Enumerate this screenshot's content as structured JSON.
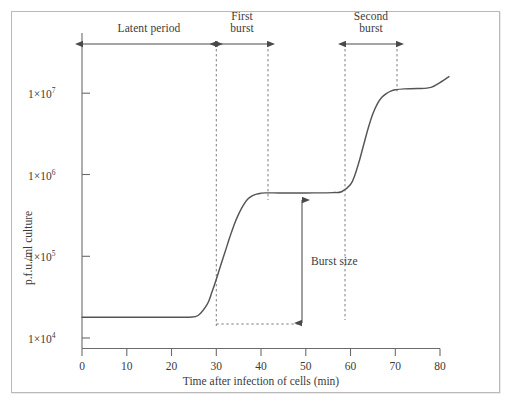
{
  "figure": {
    "frame_color": "#b9b9b9",
    "line_color": "#555555",
    "axis_color": "#6b6b6b"
  },
  "chart_data": {
    "type": "line",
    "title": "",
    "subtitle": "",
    "xlabel": "Time after infection of cells (min)",
    "ylabel": "p.f.u./ml culture",
    "xlim": [
      0,
      82
    ],
    "ylim_log10": [
      3.72,
      7.62
    ],
    "yscale": "log",
    "grid": false,
    "legend": "none",
    "x_ticks": [
      0,
      10,
      20,
      30,
      40,
      50,
      60,
      70,
      80
    ],
    "x_tick_labels": [
      "0",
      "10",
      "20",
      "30",
      "40",
      "50",
      "60",
      "70",
      "80"
    ],
    "y_ticks": [
      10000,
      100000,
      1000000,
      10000000
    ],
    "y_tick_labels": [
      "1×10",
      "1×10",
      "1×10",
      "1×10"
    ],
    "y_tick_exponents": [
      "4",
      "5",
      "6",
      "7"
    ],
    "series": [
      {
        "name": "one-step growth curve",
        "points": [
          [
            0,
            18000
          ],
          [
            5,
            18000
          ],
          [
            10,
            18000
          ],
          [
            15,
            18000
          ],
          [
            20,
            18000
          ],
          [
            24,
            18000
          ],
          [
            26,
            19000
          ],
          [
            28,
            26000
          ],
          [
            29,
            36000
          ],
          [
            30,
            52000
          ],
          [
            31,
            78000
          ],
          [
            32,
            115000
          ],
          [
            33,
            170000
          ],
          [
            34,
            245000
          ],
          [
            35,
            330000
          ],
          [
            36,
            420000
          ],
          [
            37,
            500000
          ],
          [
            38,
            550000
          ],
          [
            39,
            580000
          ],
          [
            40,
            595000
          ],
          [
            41,
            600000
          ],
          [
            44,
            600000
          ],
          [
            48,
            600000
          ],
          [
            52,
            600000
          ],
          [
            56,
            605000
          ],
          [
            58,
            620000
          ],
          [
            60,
            760000
          ],
          [
            61,
            1000000
          ],
          [
            62,
            1500000
          ],
          [
            63,
            2400000
          ],
          [
            64,
            3800000
          ],
          [
            65,
            5600000
          ],
          [
            66,
            7400000
          ],
          [
            67,
            8900000
          ],
          [
            68,
            9900000
          ],
          [
            69,
            10600000
          ],
          [
            70,
            11000000
          ],
          [
            72,
            11300000
          ],
          [
            75,
            11400000
          ],
          [
            78,
            11800000
          ],
          [
            80,
            13500000
          ],
          [
            82,
            16000000
          ]
        ]
      }
    ],
    "annotations": [
      {
        "name": "latent-period",
        "label": "Latent period",
        "label_lines": [
          "Latent period"
        ],
        "x_start": 0,
        "x_end": 30,
        "arrow": "double"
      },
      {
        "name": "first-burst",
        "label": "First burst",
        "label_lines": [
          "First",
          "burst"
        ],
        "x_start": 30,
        "x_end": 41.5,
        "arrow": "double"
      },
      {
        "name": "second-burst",
        "label": "Second burst",
        "label_lines": [
          "Second",
          "burst"
        ],
        "x_start": 58.8,
        "x_end": 70.3,
        "arrow": "double"
      },
      {
        "name": "burst-size",
        "label": "Burst size",
        "label_lines": [
          "Burst size"
        ],
        "x": 49.3,
        "y_bottom": 18000,
        "y_top": 600000,
        "arrow": "double-vertical"
      }
    ],
    "guide_lines": [
      {
        "name": "guide-30min",
        "type": "vertical-dashed",
        "x": 30
      },
      {
        "name": "guide-41min",
        "type": "vertical-dashed",
        "x": 41.5
      },
      {
        "name": "guide-59min",
        "type": "vertical-dashed",
        "x": 58.8
      },
      {
        "name": "guide-70min",
        "type": "vertical-dashed",
        "x": 70.3
      },
      {
        "name": "guide-baseline",
        "type": "horizontal-dashed",
        "y": 18000,
        "x_start": 30,
        "x_end": 49.3
      }
    ]
  }
}
